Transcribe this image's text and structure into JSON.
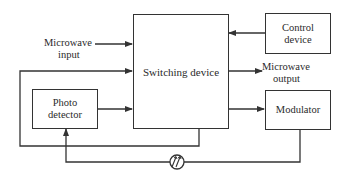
{
  "diagram": {
    "type": "block-diagram",
    "nodes": {
      "switching": {
        "label": "Switching device"
      },
      "control": {
        "line1": "Control",
        "line2": "device"
      },
      "modulator": {
        "label": "Modulator"
      },
      "photo": {
        "line1": "Photo",
        "line2": "detector"
      },
      "fiber": {
        "label": "fiber-coil-symbol"
      }
    },
    "labels": {
      "mw_input": {
        "line1": "Microwave",
        "line2": "input"
      },
      "mw_output": {
        "line1": "Microwave",
        "line2": "output"
      }
    },
    "edges": [
      {
        "from": "Microwave input",
        "to": "Switching device"
      },
      {
        "from": "Control device",
        "to": "Switching device"
      },
      {
        "from": "Switching device",
        "to": "Microwave output"
      },
      {
        "from": "Switching device",
        "to": "Modulator"
      },
      {
        "from": "Photo detector",
        "to": "Switching device"
      },
      {
        "from": "Switching device",
        "to": "Switching device (feedback loop)"
      },
      {
        "from": "Modulator",
        "to": "Photo detector",
        "via": "fiber coil"
      }
    ],
    "colors": {
      "line": "#333333",
      "background": "#ffffff"
    }
  }
}
